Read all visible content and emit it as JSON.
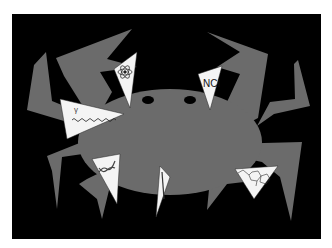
{
  "illustration": {
    "subject": "crab with triangular darts (cancer treatment metaphor)",
    "colors": {
      "background": "#000000",
      "crab": "#6b6b6b",
      "dart": "#f4f4f4",
      "page": "#ffffff"
    },
    "darts": [
      {
        "id": "atom",
        "label": "",
        "icon": "atom-icon"
      },
      {
        "id": "nci",
        "label": "NCI",
        "icon": "text-label"
      },
      {
        "id": "gamma",
        "label": "γ",
        "icon": "gamma-wave-icon"
      },
      {
        "id": "dna",
        "label": "",
        "icon": "dna-helix-icon"
      },
      {
        "id": "needle",
        "label": "",
        "icon": "needle-icon"
      },
      {
        "id": "molecule",
        "label": "",
        "icon": "chemical-structure-icon"
      }
    ]
  }
}
